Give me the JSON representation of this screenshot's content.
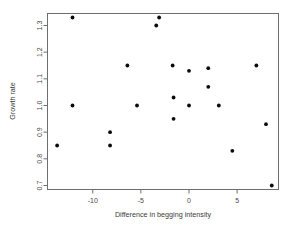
{
  "chart_data": {
    "type": "scatter",
    "title": "",
    "xlabel": "Difference in begging intensity",
    "ylabel": "Growth rate",
    "xlim": [
      -14.7,
      9.3
    ],
    "ylim": [
      0.685,
      1.345
    ],
    "grid": false,
    "legend": null,
    "xticks": [
      -10,
      -5,
      0,
      5
    ],
    "xticklabels": [
      "-10",
      "-5",
      "0",
      "5"
    ],
    "yticks": [
      0.7,
      0.8,
      0.9,
      1.0,
      1.1,
      1.2,
      1.3
    ],
    "yticklabels": [
      "0.7",
      "0.8",
      "0.9",
      "1.0",
      "1.1",
      "1.2",
      "1.3"
    ],
    "marker": "filled-circle",
    "marker_color": "#0b0b0b",
    "points": [
      {
        "x": -13.7,
        "y": 0.85
      },
      {
        "x": -12.1,
        "y": 1.33
      },
      {
        "x": -12.1,
        "y": 1.0
      },
      {
        "x": -8.2,
        "y": 0.9
      },
      {
        "x": -8.2,
        "y": 0.85
      },
      {
        "x": -6.4,
        "y": 1.15
      },
      {
        "x": -5.4,
        "y": 1.0
      },
      {
        "x": -3.4,
        "y": 1.3
      },
      {
        "x": -3.1,
        "y": 1.33
      },
      {
        "x": -1.7,
        "y": 1.15
      },
      {
        "x": -1.6,
        "y": 1.03
      },
      {
        "x": -1.6,
        "y": 0.95
      },
      {
        "x": 0.0,
        "y": 1.13
      },
      {
        "x": 0.0,
        "y": 1.0
      },
      {
        "x": 2.0,
        "y": 1.14
      },
      {
        "x": 2.0,
        "y": 1.07
      },
      {
        "x": 3.1,
        "y": 1.0
      },
      {
        "x": 4.5,
        "y": 0.83
      },
      {
        "x": 7.0,
        "y": 1.15
      },
      {
        "x": 8.0,
        "y": 0.93
      },
      {
        "x": 8.6,
        "y": 0.7
      }
    ]
  }
}
